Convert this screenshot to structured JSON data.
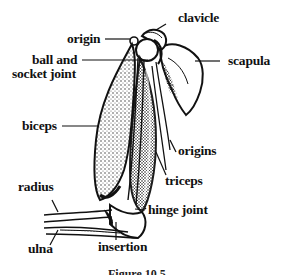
{
  "figure": {
    "caption": "Figure 10.5",
    "labels": {
      "clavicle": "clavicle",
      "origin": "origin",
      "ball_and_socket_line1": "ball and",
      "ball_and_socket_line2": "socket joint",
      "scapula": "scapula",
      "biceps": "biceps",
      "origins": "origins",
      "triceps": "triceps",
      "radius": "radius",
      "hinge_joint": "hinge joint",
      "ulna": "ulna",
      "insertion": "insertion"
    },
    "colors": {
      "ink": "#111111",
      "background": "#ffffff",
      "stipple": "#333333"
    }
  }
}
